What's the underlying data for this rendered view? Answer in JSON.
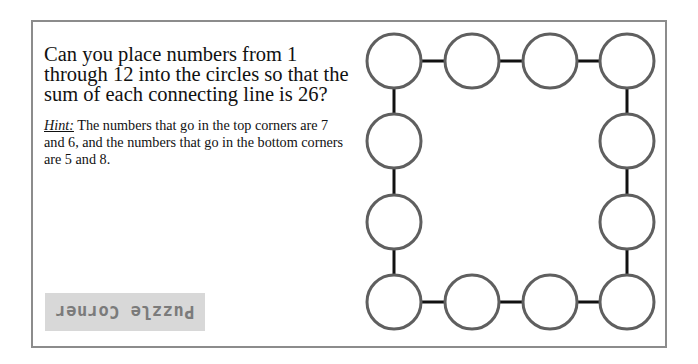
{
  "puzzle": {
    "question": "Can you place numbers from 1 through 12 into the circles so that the sum of each connecting line is 26?",
    "hint_label": "Hint:",
    "hint_text": " The numbers that go in the top corners are 7 and 6, and the numbers that go in the bottom corners are 5 and 8.",
    "badge_label": "Puzzle Corner",
    "target_sum": 26,
    "number_range": [
      1,
      12
    ],
    "circle_count": 12,
    "circles": {
      "top_row": [
        "",
        "",
        "",
        ""
      ],
      "right_column": [
        "",
        ""
      ],
      "bottom_row": [
        "",
        "",
        "",
        ""
      ],
      "left_column": [
        "",
        ""
      ]
    }
  },
  "colors": {
    "frame_border": "#8c8c8c",
    "circle_stroke": "#5f5f5f",
    "connector": "#111111",
    "badge_bg": "#d8d8d8",
    "badge_text": "#7b7b7b"
  }
}
